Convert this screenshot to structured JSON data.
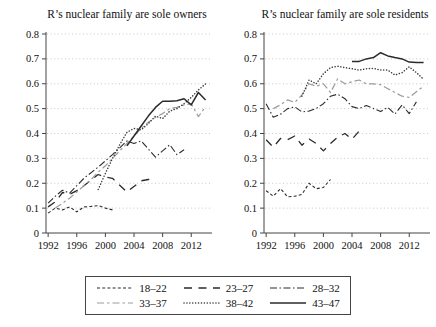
{
  "figure": {
    "legend": {
      "entries": [
        {
          "label": "18–22",
          "pattern": "shortdash",
          "color": "#2b2b2b"
        },
        {
          "label": "23–27",
          "pattern": "longdash",
          "color": "#2b2b2b"
        },
        {
          "label": "28–32",
          "pattern": "dashdot",
          "color": "#2b2b2b"
        },
        {
          "label": "33–37",
          "pattern": "graydash",
          "color": "#9b9b9b"
        },
        {
          "label": "38–42",
          "pattern": "dot",
          "color": "#3a3a3a"
        },
        {
          "label": "43–47",
          "pattern": "solid",
          "color": "#2b2b2b"
        }
      ]
    },
    "colors": {
      "grid": "#c6c6c6",
      "axis": "#444444",
      "text": "#111111"
    }
  },
  "chart_data": [
    {
      "type": "line",
      "title": "R’s nuclear family are sole owners",
      "xlabel": "",
      "ylabel": "",
      "xlim": [
        1991.7,
        2014.9
      ],
      "ylim": [
        0,
        0.8
      ],
      "x_ticks": [
        1992,
        1996,
        2000,
        2004,
        2008,
        2012
      ],
      "y_ticks": [
        0,
        0.1,
        0.2,
        0.3,
        0.4,
        0.5,
        0.6,
        0.7,
        0.8
      ],
      "grid": "horizontal-dotted",
      "legend_position": "below-figure",
      "series": [
        {
          "label": "18–22",
          "points": [
            [
              1992,
              0.08
            ],
            [
              1993,
              0.1
            ],
            [
              1994,
              0.093
            ],
            [
              1995,
              0.105
            ],
            [
              1996,
              0.085
            ],
            [
              1997,
              0.105
            ],
            [
              1998,
              0.107
            ],
            [
              1999,
              0.11
            ],
            [
              2000,
              0.1
            ],
            [
              2001,
              0.093
            ]
          ]
        },
        {
          "label": "23–27",
          "points": [
            [
              1992,
              0.105
            ],
            [
              1993,
              0.125
            ],
            [
              1994,
              0.163
            ],
            [
              1995,
              0.155
            ],
            [
              1996,
              0.17
            ],
            [
              1997,
              0.19
            ],
            [
              1999,
              0.235
            ],
            [
              2000,
              0.225
            ],
            [
              2001,
              0.22
            ],
            [
              2003,
              0.165
            ],
            [
              2005,
              0.21
            ],
            [
              2006,
              0.215
            ],
            [
              2007,
              0.22
            ]
          ]
        },
        {
          "label": "28–32",
          "points": [
            [
              1992,
              0.12
            ],
            [
              1993,
              0.148
            ],
            [
              1994,
              0.172
            ],
            [
              1995,
              0.16
            ],
            [
              1996,
              0.19
            ],
            [
              1997,
              0.22
            ],
            [
              1999,
              0.265
            ],
            [
              2001,
              0.315
            ],
            [
              2003,
              0.37
            ],
            [
              2004,
              0.36
            ],
            [
              2005,
              0.37
            ],
            [
              2007,
              0.305
            ],
            [
              2008,
              0.33
            ],
            [
              2009,
              0.355
            ],
            [
              2010,
              0.315
            ],
            [
              2011,
              0.335
            ]
          ]
        },
        {
          "label": "33–37",
          "points": [
            [
              1993,
              0.1
            ],
            [
              1994,
              0.12
            ],
            [
              1995,
              0.14
            ],
            [
              1996,
              0.165
            ],
            [
              1997,
              0.19
            ],
            [
              1998,
              0.215
            ],
            [
              1999,
              0.245
            ],
            [
              2000,
              0.27
            ],
            [
              2001,
              0.3
            ],
            [
              2002,
              0.33
            ],
            [
              2003,
              0.36
            ],
            [
              2004,
              0.39
            ],
            [
              2005,
              0.42
            ],
            [
              2006,
              0.445
            ],
            [
              2007,
              0.465
            ],
            [
              2008,
              0.48
            ],
            [
              2009,
              0.5
            ],
            [
              2010,
              0.505
            ],
            [
              2011,
              0.515
            ],
            [
              2012,
              0.52
            ],
            [
              2013,
              0.468
            ],
            [
              2014,
              0.508
            ]
          ]
        },
        {
          "label": "38–42",
          "points": [
            [
              1999,
              0.175
            ],
            [
              2000,
              0.24
            ],
            [
              2001,
              0.3
            ],
            [
              2002,
              0.355
            ],
            [
              2003,
              0.405
            ],
            [
              2004,
              0.42
            ],
            [
              2005,
              0.415
            ],
            [
              2006,
              0.44
            ],
            [
              2007,
              0.47
            ],
            [
              2008,
              0.46
            ],
            [
              2009,
              0.49
            ],
            [
              2010,
              0.5
            ],
            [
              2011,
              0.52
            ],
            [
              2012,
              0.545
            ],
            [
              2013,
              0.575
            ],
            [
              2014,
              0.6
            ]
          ]
        },
        {
          "label": "43–47",
          "points": [
            [
              2003,
              0.35
            ],
            [
              2004,
              0.39
            ],
            [
              2005,
              0.43
            ],
            [
              2006,
              0.47
            ],
            [
              2007,
              0.505
            ],
            [
              2008,
              0.53
            ],
            [
              2009,
              0.53
            ],
            [
              2010,
              0.532
            ],
            [
              2011,
              0.54
            ],
            [
              2012,
              0.515
            ],
            [
              2013,
              0.565
            ],
            [
              2014,
              0.535
            ]
          ]
        }
      ]
    },
    {
      "type": "line",
      "title": "R’s nuclear family are sole residents",
      "xlabel": "",
      "ylabel": "",
      "xlim": [
        1991.7,
        2014.9
      ],
      "ylim": [
        0,
        0.8
      ],
      "x_ticks": [
        1992,
        1996,
        2000,
        2004,
        2008,
        2012
      ],
      "y_ticks": [
        0,
        0.1,
        0.2,
        0.3,
        0.4,
        0.5,
        0.6,
        0.7,
        0.8
      ],
      "grid": "horizontal-dotted",
      "legend_position": "below-figure",
      "series": [
        {
          "label": "18–22",
          "points": [
            [
              1992,
              0.17
            ],
            [
              1993,
              0.148
            ],
            [
              1994,
              0.178
            ],
            [
              1995,
              0.145
            ],
            [
              1996,
              0.148
            ],
            [
              1997,
              0.155
            ],
            [
              1998,
              0.2
            ],
            [
              1999,
              0.178
            ],
            [
              2000,
              0.183
            ],
            [
              2001,
              0.215
            ]
          ]
        },
        {
          "label": "23–27",
          "points": [
            [
              1992,
              0.375
            ],
            [
              1993,
              0.345
            ],
            [
              1994,
              0.38
            ],
            [
              1995,
              0.375
            ],
            [
              1996,
              0.39
            ],
            [
              1997,
              0.353
            ],
            [
              1998,
              0.378
            ],
            [
              1999,
              0.36
            ],
            [
              2000,
              0.33
            ],
            [
              2001,
              0.36
            ],
            [
              2002,
              0.385
            ],
            [
              2003,
              0.4
            ],
            [
              2004,
              0.377
            ],
            [
              2005,
              0.41
            ]
          ]
        },
        {
          "label": "28–32",
          "points": [
            [
              1992,
              0.52
            ],
            [
              1993,
              0.465
            ],
            [
              1994,
              0.477
            ],
            [
              1995,
              0.5
            ],
            [
              1996,
              0.507
            ],
            [
              1997,
              0.487
            ],
            [
              1998,
              0.49
            ],
            [
              1999,
              0.5
            ],
            [
              2000,
              0.52
            ],
            [
              2001,
              0.55
            ],
            [
              2002,
              0.558
            ],
            [
              2003,
              0.54
            ],
            [
              2004,
              0.508
            ],
            [
              2005,
              0.5
            ],
            [
              2006,
              0.512
            ],
            [
              2007,
              0.5
            ],
            [
              2008,
              0.488
            ],
            [
              2009,
              0.505
            ],
            [
              2010,
              0.478
            ],
            [
              2011,
              0.515
            ],
            [
              2012,
              0.48
            ],
            [
              2013,
              0.527
            ]
          ]
        },
        {
          "label": "33–37",
          "points": [
            [
              1993,
              0.5
            ],
            [
              1994,
              0.515
            ],
            [
              1995,
              0.535
            ],
            [
              1996,
              0.525
            ],
            [
              1997,
              0.555
            ],
            [
              1998,
              0.6
            ],
            [
              1999,
              0.59
            ],
            [
              2000,
              0.6
            ],
            [
              2001,
              0.565
            ],
            [
              2002,
              0.62
            ],
            [
              2003,
              0.6
            ],
            [
              2004,
              0.608
            ],
            [
              2005,
              0.615
            ],
            [
              2006,
              0.6
            ],
            [
              2007,
              0.6
            ],
            [
              2008,
              0.596
            ],
            [
              2009,
              0.58
            ],
            [
              2010,
              0.565
            ],
            [
              2011,
              0.55
            ],
            [
              2012,
              0.545
            ],
            [
              2013,
              0.568
            ],
            [
              2014,
              0.59
            ]
          ]
        },
        {
          "label": "38–42",
          "points": [
            [
              1997,
              0.55
            ],
            [
              1998,
              0.615
            ],
            [
              1999,
              0.6
            ],
            [
              2000,
              0.64
            ],
            [
              2001,
              0.665
            ],
            [
              2002,
              0.67
            ],
            [
              2003,
              0.665
            ],
            [
              2004,
              0.66
            ],
            [
              2005,
              0.655
            ],
            [
              2006,
              0.66
            ],
            [
              2007,
              0.662
            ],
            [
              2008,
              0.655
            ],
            [
              2009,
              0.655
            ],
            [
              2010,
              0.635
            ],
            [
              2011,
              0.645
            ],
            [
              2012,
              0.668
            ],
            [
              2013,
              0.645
            ],
            [
              2014,
              0.618
            ]
          ]
        },
        {
          "label": "43–47",
          "points": [
            [
              2004,
              0.69
            ],
            [
              2005,
              0.69
            ],
            [
              2006,
              0.7
            ],
            [
              2007,
              0.705
            ],
            [
              2008,
              0.725
            ],
            [
              2009,
              0.712
            ],
            [
              2010,
              0.705
            ],
            [
              2011,
              0.7
            ],
            [
              2012,
              0.687
            ],
            [
              2013,
              0.685
            ],
            [
              2014,
              0.685
            ]
          ]
        }
      ]
    }
  ]
}
